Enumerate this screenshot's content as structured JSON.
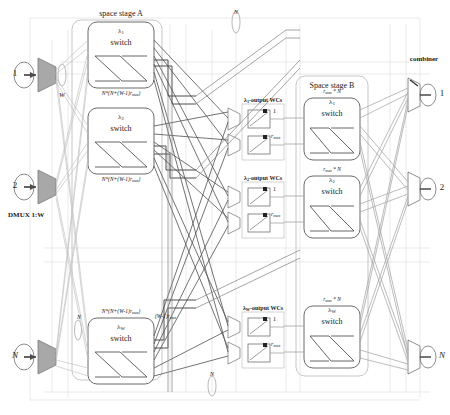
{
  "figure": {
    "type": "optical-switch-architecture-diagram",
    "title_stage_a": "space stage A",
    "title_stage_b": "Space stage B",
    "combiner_label": "combiner",
    "dmux_label": "DMUX 1:W",
    "w_label": "W",
    "bundle_n_top": "N",
    "bundle_n_bottom": "N",
    "bundle_n_left_upper": "N",
    "bundle_n_left_lower": "N"
  },
  "inputs": [
    {
      "id": "in-1",
      "label": "1"
    },
    {
      "id": "in-2",
      "label": "2"
    },
    {
      "id": "in-N",
      "label": "N"
    }
  ],
  "outputs": [
    {
      "id": "out-1",
      "label": "1"
    },
    {
      "id": "out-2",
      "label": "2"
    },
    {
      "id": "out-N",
      "label": "N"
    }
  ],
  "stage_a": {
    "heading": "space stage A",
    "switches": [
      {
        "id": "a-lambda-1",
        "lambda": "λ",
        "sub": "1",
        "switch_word": "switch",
        "size_label": "N*(N+(W-1)r",
        "size_sub": "max",
        "size_tail": ")"
      },
      {
        "id": "a-lambda-2",
        "lambda": "λ",
        "sub": "2",
        "switch_word": "switch",
        "size_label": "N*(N+(W-1)r",
        "size_sub": "max",
        "size_tail": ")"
      },
      {
        "id": "a-lambda-W",
        "lambda": "λ",
        "sub": "W",
        "switch_word": "switch",
        "size_label": "N*(N+(W-1)r",
        "size_sub": "max",
        "size_tail": ")"
      }
    ],
    "extra_label": "(W-1)r",
    "extra_label_sub": "max"
  },
  "wc_groups": [
    {
      "id": "wc-lambda-1",
      "heading_prefix": "λ",
      "heading_sub": "1",
      "heading_suffix": "-output WCs",
      "converters": [
        {
          "id": "wc-1-1",
          "label": "1"
        },
        {
          "id": "wc-1-rmax",
          "label": "r",
          "sub": "max"
        }
      ]
    },
    {
      "id": "wc-lambda-2",
      "heading_prefix": "λ",
      "heading_sub": "2",
      "heading_suffix": "-output WCs",
      "converters": [
        {
          "id": "wc-2-1",
          "label": "1"
        },
        {
          "id": "wc-2-rmax",
          "label": "r",
          "sub": "max"
        }
      ]
    },
    {
      "id": "wc-lambda-W",
      "heading_prefix": "λ",
      "heading_sub": "W",
      "heading_suffix": "-output WCs",
      "converters": [
        {
          "id": "wc-W-1",
          "label": "1"
        },
        {
          "id": "wc-W-rmax",
          "label": "r",
          "sub": "max"
        }
      ]
    }
  ],
  "stage_b": {
    "heading": "Space stage B",
    "switches": [
      {
        "id": "b-lambda-1",
        "lambda": "λ",
        "sub": "1",
        "switch_word": "switch",
        "size_prefix": "r",
        "size_sub": "max",
        "size_suffix": "* N"
      },
      {
        "id": "b-lambda-2",
        "lambda": "λ",
        "sub": "2",
        "switch_word": "switch",
        "size_prefix": "r",
        "size_sub": "max",
        "size_suffix": "* N"
      },
      {
        "id": "b-lambda-W",
        "lambda": "λ",
        "sub": "W",
        "switch_word": "switch",
        "size_prefix": "r",
        "size_sub": "max",
        "size_suffix": "* N"
      }
    ]
  },
  "colors": {
    "line_dark": "#4d4d4d",
    "line_mid": "#8c8c8c",
    "line_light": "#bfbfbf",
    "line_faint": "#d8d8d8",
    "box_stroke": "#6b6b6b",
    "group_stroke": "#b5b5b5",
    "triangle_fill": "#a8a8a8",
    "text": "#1a1a1a"
  }
}
